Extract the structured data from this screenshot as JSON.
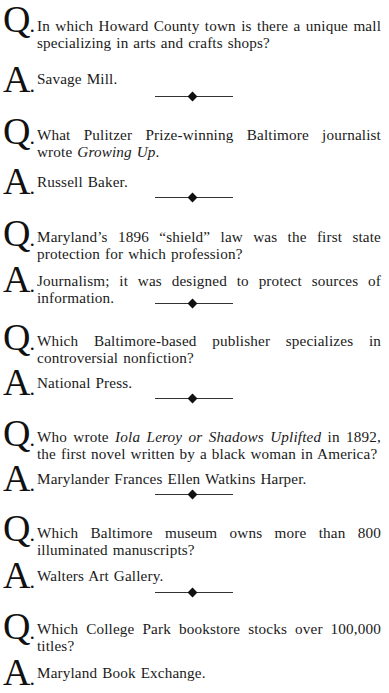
{
  "labels": {
    "question": "Q",
    "answer": "A",
    "dot": "."
  },
  "items": [
    {
      "question": "In which Howard County town is there a unique mall specializing in arts and crafts shops?",
      "answer": "Savage Mill."
    },
    {
      "question_pre": "What Pulitzer Prize-winning Baltimore journalist wrote ",
      "question_italic": "Growing Up",
      "question_post": ".",
      "answer": "Russell Baker."
    },
    {
      "question": "Maryland’s 1896 “shield” law was the first state protection for which profession?",
      "answer": "Journalism; it was designed to protect sources of information."
    },
    {
      "question": "Which Baltimore-based publisher specializes in controversial nonfiction?",
      "answer": "National Press."
    },
    {
      "question_pre": "Who wrote ",
      "question_italic": "Iola Leroy or Shadows Uplifted",
      "question_post": " in 1892, the first novel written by a black woman in America?",
      "answer": "Marylander Frances Ellen Watkins Harper."
    },
    {
      "question": "Which Baltimore museum owns more than 800 illuminated manuscripts?",
      "answer": "Walters Art Gallery."
    },
    {
      "question": "Which College Park bookstore stocks over 100,000 titles?",
      "answer": "Maryland Book Exchange."
    }
  ],
  "divider_icon": "diamond-rule"
}
